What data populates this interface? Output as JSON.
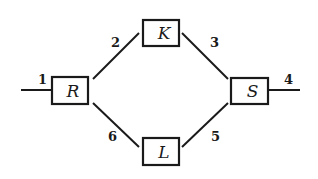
{
  "diagram": {
    "type": "network-graph",
    "nodes": [
      {
        "id": "R",
        "label": "R",
        "x": 52,
        "y": 77,
        "w": 36,
        "h": 27
      },
      {
        "id": "K",
        "label": "K",
        "x": 143,
        "y": 20,
        "w": 36,
        "h": 26
      },
      {
        "id": "S",
        "label": "S",
        "x": 231,
        "y": 78,
        "w": 37,
        "h": 26
      },
      {
        "id": "L",
        "label": "L",
        "x": 143,
        "y": 138,
        "w": 36,
        "h": 27
      }
    ],
    "edges": [
      {
        "id": "1",
        "label": "1",
        "from": "input",
        "to": "R",
        "x1": 21,
        "y1": 90,
        "x2": 52,
        "y2": 90,
        "lx": 38,
        "ly": 84
      },
      {
        "id": "2",
        "label": "2",
        "from": "R",
        "to": "K",
        "x1": 93,
        "y1": 79,
        "x2": 139,
        "y2": 33,
        "lx": 111,
        "ly": 47
      },
      {
        "id": "3",
        "label": "3",
        "from": "K",
        "to": "S",
        "x1": 182,
        "y1": 33,
        "x2": 228,
        "y2": 79,
        "lx": 210,
        "ly": 47
      },
      {
        "id": "4",
        "label": "4",
        "from": "S",
        "to": "output",
        "x1": 268,
        "y1": 90,
        "x2": 300,
        "y2": 90,
        "lx": 284,
        "ly": 84
      },
      {
        "id": "5",
        "label": "5",
        "from": "S",
        "to": "L",
        "x1": 228,
        "y1": 103,
        "x2": 182,
        "y2": 147,
        "lx": 211,
        "ly": 141
      },
      {
        "id": "6",
        "label": "6",
        "from": "R",
        "to": "L",
        "x1": 93,
        "y1": 103,
        "x2": 139,
        "y2": 147,
        "lx": 108,
        "ly": 141
      }
    ],
    "colors": {
      "stroke": "#1a1a1a",
      "background": "#ffffff"
    }
  }
}
